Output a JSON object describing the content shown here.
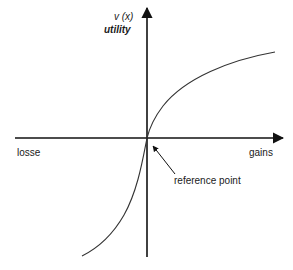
{
  "diagram": {
    "type": "value-function",
    "y_axis": {
      "label_symbol": "v (x)",
      "label_name": "utility"
    },
    "x_axis": {
      "left_label": "losse",
      "right_label": "gains"
    },
    "annotation": {
      "text": "reference point"
    },
    "colors": {
      "axis": "#111111",
      "curve": "#333333",
      "background": "#ffffff"
    }
  }
}
